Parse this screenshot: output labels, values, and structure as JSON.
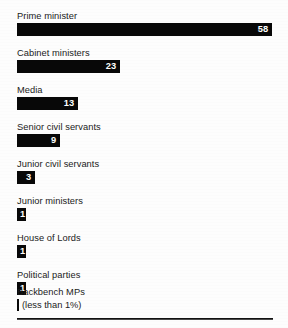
{
  "chart_data": {
    "type": "bar",
    "orientation": "horizontal",
    "title": "",
    "subtitle": "",
    "xlabel": "",
    "ylabel": "",
    "grid": false,
    "legend": null,
    "value_suffix": "%",
    "xlim": [
      0,
      58
    ],
    "categories": [
      "Prime minister",
      "Cabinet ministers",
      "Media",
      "Senior civil servants",
      "Junior civil servants",
      "Junior ministers",
      "House of Lords",
      "Political parties",
      "Backbench MPs"
    ],
    "values": [
      58,
      23,
      13,
      9,
      3,
      1,
      1,
      1,
      0.4
    ],
    "value_labels": [
      "58",
      "23",
      "13",
      "9",
      "3",
      "1",
      "1",
      "1",
      ""
    ],
    "annotations": [
      {
        "category": "Backbench MPs",
        "text": "(less than 1%)"
      }
    ]
  },
  "rows": [
    {
      "label": "Prime minister",
      "value_label": "58",
      "bar_width": 255,
      "top": 11
    },
    {
      "label": "Cabinet ministers",
      "value_label": "23",
      "bar_width": 103,
      "top": 48
    },
    {
      "label": "Media",
      "value_label": "13",
      "bar_width": 61,
      "top": 85
    },
    {
      "label": "Senior civil servants",
      "value_label": "9",
      "bar_width": 43,
      "top": 122
    },
    {
      "label": "Junior civil servants",
      "value_label": "3",
      "bar_width": 18,
      "top": 159
    },
    {
      "label": "Junior ministers",
      "value_label": "1",
      "bar_width": 9,
      "top": 196
    },
    {
      "label": "House of Lords",
      "value_label": "1",
      "bar_width": 9,
      "top": 233
    },
    {
      "label": "Political parties",
      "value_label": "1",
      "bar_width": 9,
      "top": 270
    }
  ],
  "footnote_row": {
    "label": "Backbench MPs",
    "note": "(less than 1%)",
    "top": 287
  },
  "colors": {
    "bar": "#080808",
    "background": "#ffffff",
    "label_text": "#1b1b1b",
    "value_text": "#ffffff",
    "baseline": "#121212"
  }
}
